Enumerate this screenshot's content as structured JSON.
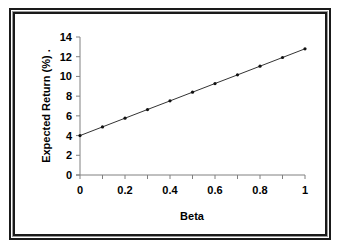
{
  "chart_data": {
    "type": "line",
    "title": "",
    "xlabel": "Beta",
    "ylabel": "Expected Return (%) .",
    "x": [
      0,
      0.1,
      0.2,
      0.3,
      0.4,
      0.5,
      0.6,
      0.7,
      0.8,
      0.9,
      1.0
    ],
    "series": [
      {
        "name": "Expected Return",
        "values": [
          4.0,
          4.88,
          5.76,
          6.64,
          7.52,
          8.4,
          9.28,
          10.16,
          11.04,
          11.92,
          12.8
        ],
        "color": "#333333",
        "marker": "dot"
      }
    ],
    "xlim": [
      0,
      1
    ],
    "ylim": [
      0,
      14
    ],
    "xticks": [
      0,
      0.2,
      0.4,
      0.6,
      0.8,
      1
    ],
    "xtick_labels": [
      "0",
      "0.2",
      "0.4",
      "0.6",
      "0.8",
      "1"
    ],
    "xminor_ticks": [
      0.1,
      0.3,
      0.5,
      0.7,
      0.9
    ],
    "yticks": [
      0,
      2,
      4,
      6,
      8,
      10,
      12,
      14
    ],
    "ytick_labels": [
      "0",
      "2",
      "4",
      "6",
      "8",
      "10",
      "12",
      "14"
    ],
    "grid": false,
    "legend": "none"
  }
}
